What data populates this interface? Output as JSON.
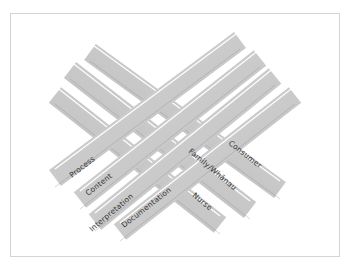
{
  "diagram": {
    "type": "woven-strands",
    "colors": {
      "strand_fill": "#c9c9c9",
      "strand_dark": "#8a8a8a",
      "strand_light": "#e8e8e8",
      "frame_border": "#d4d4d4",
      "label_text": "#333333"
    },
    "strands_left": [
      {
        "label": "Process"
      },
      {
        "label": "Content"
      },
      {
        "label": "Interpretation"
      },
      {
        "label": "Documentation"
      }
    ],
    "strands_right": [
      {
        "label": "Family/Whānau"
      },
      {
        "label": "Consumer"
      },
      {
        "label": "Nurse"
      }
    ]
  }
}
